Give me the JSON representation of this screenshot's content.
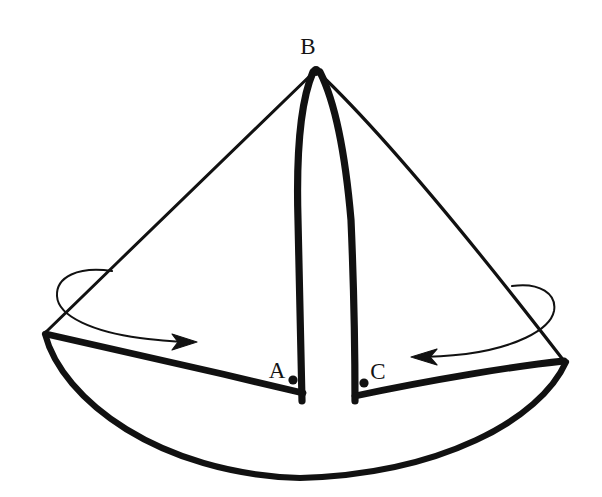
{
  "figure": {
    "background_color": "#ffffff",
    "ink_color": "#111111",
    "width": 602,
    "height": 497
  },
  "labels": {
    "apex": "B",
    "left_slit": "A",
    "right_slit": "C"
  },
  "label_positions": {
    "apex": {
      "x": 308,
      "y": 54
    },
    "left_slit": {
      "x": 267,
      "y": 378
    },
    "right_slit": {
      "x": 368,
      "y": 379
    }
  },
  "points": {
    "apex_dot": {
      "x": 316,
      "y": 71,
      "r": 5.0
    },
    "left_slit_dot": {
      "x": 293,
      "y": 380,
      "r": 4.6
    },
    "right_slit_dot": {
      "x": 364,
      "y": 383,
      "r": 4.6
    }
  },
  "geometry": {
    "apex": {
      "x": 316,
      "y": 70
    },
    "left_corner": {
      "x": 45,
      "y": 333
    },
    "right_corner": {
      "x": 565,
      "y": 362
    },
    "left_slit_base": {
      "x": 302,
      "y": 400
    },
    "right_slit_base": {
      "x": 355,
      "y": 400
    },
    "arc_low_point": {
      "x": 300,
      "y": 478
    }
  },
  "strokes": {
    "thin_edge_width": 3.0,
    "thick_edge_width": 6.5,
    "arrow_line_width": 2.0
  },
  "arrows": {
    "left": {
      "name": "left-roll-arrow",
      "direction": "right",
      "tip": {
        "x": 196,
        "y": 342
      }
    },
    "right": {
      "name": "right-roll-arrow",
      "direction": "left",
      "tip": {
        "x": 412,
        "y": 357
      }
    }
  }
}
